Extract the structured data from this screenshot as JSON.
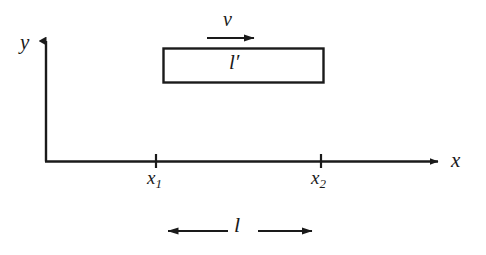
{
  "figure": {
    "background_color": "#ffffff",
    "stroke_color": "#1a1a1a",
    "width": 486,
    "height": 255
  },
  "axes": {
    "y_axis_label": "y",
    "x_axis_label": "x",
    "origin_x": 46,
    "origin_y": 161,
    "x_axis_end": 446,
    "y_axis_end": 34
  },
  "ticks": [
    {
      "label": "x",
      "sub": "1",
      "x": 156
    },
    {
      "label": "x",
      "sub": "2",
      "x": 321
    }
  ],
  "rod": {
    "label": "l′",
    "left": 163,
    "right": 324,
    "top": 48,
    "bottom": 83,
    "fill": "#ffffff",
    "stroke": "#1a1a1a"
  },
  "velocity_arrow": {
    "label": "v",
    "start_x": 207,
    "end_x": 263,
    "y": 38
  },
  "length_dimension": {
    "label": "l",
    "left_x": 157,
    "right_x": 322,
    "y": 231
  }
}
